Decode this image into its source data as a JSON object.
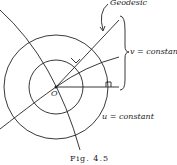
{
  "diagram": {
    "labels": {
      "geodesic": "Geodesic",
      "v_constant": "v = constant",
      "u_constant": "u = constant",
      "origin": "O"
    },
    "caption": "Fig. 4.5",
    "colors": {
      "stroke": "#222222",
      "background": "#ffffff"
    }
  }
}
